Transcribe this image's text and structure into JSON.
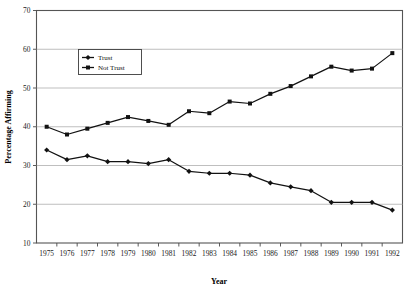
{
  "chart_data": {
    "type": "line",
    "title": "",
    "xlabel": "Year",
    "ylabel": "Percentage Affirming",
    "x": [
      1975,
      1976,
      1977,
      1978,
      1979,
      1980,
      1981,
      1982,
      1983,
      1984,
      1985,
      1986,
      1987,
      1988,
      1989,
      1990,
      1991,
      1992
    ],
    "categories": [
      "1975",
      "1976",
      "1977",
      "1978",
      "1979",
      "1980",
      "1981",
      "1982",
      "1983",
      "1984",
      "1985",
      "1986",
      "1987",
      "1988",
      "1989",
      "1990",
      "1991",
      "1992"
    ],
    "series": [
      {
        "name": "Trust",
        "marker": "diamond",
        "color": "#121212",
        "values": [
          34,
          31.5,
          32.5,
          31,
          31,
          30.5,
          31.5,
          28.5,
          28,
          28,
          27.5,
          25.5,
          24.5,
          23.5,
          20.5,
          20.5,
          20.5,
          18.5
        ]
      },
      {
        "name": "Not Trust",
        "marker": "square",
        "color": "#121212",
        "values": [
          40,
          38,
          39.5,
          41,
          42.5,
          41.5,
          40.5,
          44,
          43.5,
          46.5,
          46,
          48.5,
          50.5,
          53,
          55.5,
          54.5,
          55,
          59
        ]
      }
    ],
    "ylim": [
      10,
      70
    ],
    "yticks": [
      10,
      20,
      30,
      40,
      50,
      60,
      70
    ],
    "ytick_labels": [
      "10",
      "20",
      "30",
      "40",
      "50",
      "60",
      "70"
    ],
    "grid": true,
    "grid_axis": "y",
    "legend_position": "upper-left-inside",
    "colors": {
      "line": "#121212",
      "grid": "#aeaeae",
      "frame": "#555555",
      "background": "#ffffff",
      "text": "#111111"
    }
  }
}
